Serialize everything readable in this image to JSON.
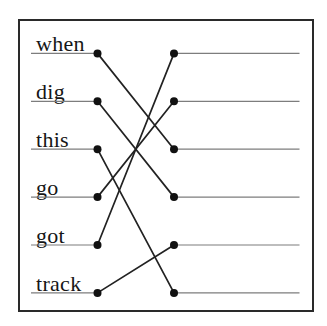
{
  "exercise": {
    "kind": "word-matching-worksheet",
    "left_words": [
      "when",
      "dig",
      "this",
      "go",
      "got",
      "track"
    ],
    "right_blank_count": 6,
    "connections": [
      {
        "from_word": "when",
        "from_index": 0,
        "to_slot_index": 2
      },
      {
        "from_word": "dig",
        "from_index": 1,
        "to_slot_index": 3
      },
      {
        "from_word": "this",
        "from_index": 2,
        "to_slot_index": 5
      },
      {
        "from_word": "go",
        "from_index": 3,
        "to_slot_index": 1
      },
      {
        "from_word": "got",
        "from_index": 4,
        "to_slot_index": 4
      },
      {
        "from_word": "track",
        "from_index": 5,
        "to_slot_index": 4
      }
    ],
    "connections_pairs": [
      [
        0,
        2
      ],
      [
        1,
        3
      ],
      [
        2,
        5
      ],
      [
        3,
        1
      ],
      [
        4,
        0
      ],
      [
        5,
        4
      ]
    ]
  },
  "colors": {
    "background": "#ffffff",
    "border": "#2a2a2a",
    "text": "#161616",
    "guide_line": "#7d7d7d",
    "connector_line": "#222222",
    "dot": "#111111"
  }
}
